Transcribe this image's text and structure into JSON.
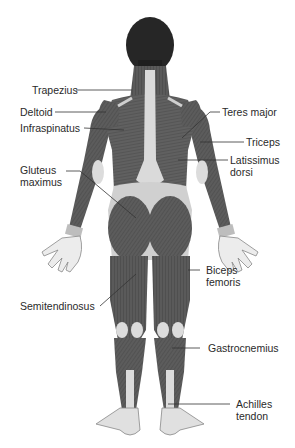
{
  "diagram": {
    "palette": {
      "background": "#ffffff",
      "muscle": "#5a5a5a",
      "muscle_dark": "#3f3f3f",
      "tendon": "#d8d8d8",
      "skin": "#e6e6e6",
      "hair": "#222222",
      "leader_line": "#333333",
      "text": "#2a2a2a"
    },
    "labels_left": [
      {
        "text": "Trapezius"
      },
      {
        "text": "Deltoid"
      },
      {
        "text": "Infraspinatus"
      },
      {
        "text": "Gluteus",
        "line2": "maximus"
      },
      {
        "text": "Semitendinosus"
      }
    ],
    "labels_right": [
      {
        "text": "Teres major"
      },
      {
        "text": "Triceps"
      },
      {
        "text": "Latissimus",
        "line2": "dorsi"
      },
      {
        "text": "Biceps",
        "line2": "femoris"
      },
      {
        "text": "Gastrocnemius"
      },
      {
        "text": "Achilles",
        "line2": "tendon"
      }
    ]
  }
}
